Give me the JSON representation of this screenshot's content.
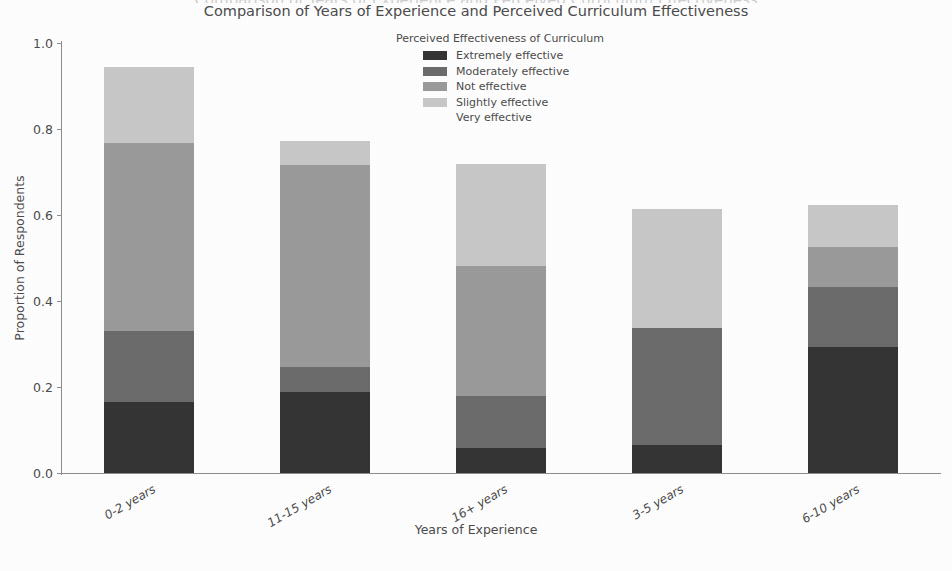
{
  "clipped_header": "Comparison of Years of Experience and Perceived Curriculum Effectiveness",
  "title": "Comparison of Years of Experience and Perceived Curriculum Effectiveness",
  "axis": {
    "ylabel": "Proportion of Respondents",
    "xlabel": "Years of Experience"
  },
  "legend": {
    "title": "Perceived Effectiveness of Curriculum",
    "entries": [
      {
        "label": "Extremely effective",
        "color": "#333333"
      },
      {
        "label": "Moderately effective",
        "color": "#6b6b6b"
      },
      {
        "label": "Not effective",
        "color": "#9a9a9a"
      },
      {
        "label": "Slightly effective",
        "color": "#c8c8c8"
      },
      {
        "label": "Very effective",
        "color": "#ffffff"
      }
    ]
  },
  "chart_data": {
    "type": "bar",
    "subtype": "stacked",
    "title": "Comparison of Years of Experience and Perceived Curriculum Effectiveness",
    "xlabel": "Years of Experience",
    "ylabel": "Proportion of Respondents",
    "ylim": [
      0.0,
      1.0
    ],
    "yticks": [
      "0.0",
      "0.2",
      "0.4",
      "0.6",
      "0.8",
      "1.0"
    ],
    "ytick_values": [
      0.0,
      0.2,
      0.4,
      0.6,
      0.8,
      1.0
    ],
    "grid": false,
    "legend_position": "upper center",
    "legend_title": "Perceived Effectiveness of Curriculum",
    "categories": [
      "0-2 years",
      "11-15 years",
      "16+ years",
      "3-5 years",
      "6-10 years"
    ],
    "series": [
      {
        "name": "Extremely effective",
        "color": "#333333",
        "values": [
          0.165,
          0.188,
          0.058,
          0.065,
          0.293
        ]
      },
      {
        "name": "Moderately effective",
        "color": "#6b6b6b",
        "values": [
          0.165,
          0.059,
          0.121,
          0.272,
          0.14
        ]
      },
      {
        "name": "Not effective",
        "color": "#9a9a9a",
        "values": [
          0.437,
          0.469,
          0.302,
          0.0,
          0.093
        ]
      },
      {
        "name": "Slightly effective",
        "color": "#c8c8c8",
        "values": [
          0.178,
          0.056,
          0.238,
          0.277,
          0.097
        ]
      },
      {
        "name": "Very effective",
        "color": "#ffffff",
        "values": [
          0.0,
          0.0,
          0.0,
          0.0,
          0.0
        ]
      }
    ],
    "totals": [
      0.945,
      0.772,
      0.719,
      0.614,
      0.623
    ]
  }
}
